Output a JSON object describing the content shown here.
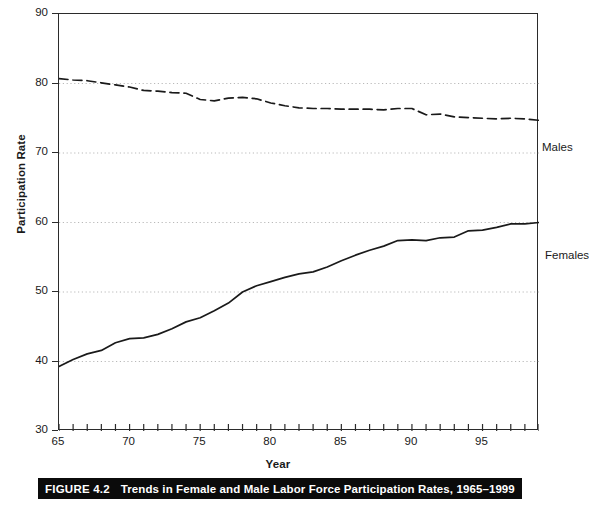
{
  "figure": {
    "caption_number": "FIGURE 4.2",
    "caption_text": "Trends in Female and Male Labor Force Participation Rates, 1965–1999"
  },
  "chart_data": {
    "type": "line",
    "title": "Trends in Female and Male Labor Force Participation Rates, 1965–1999",
    "xlabel": "Year",
    "ylabel": "Participation Rate",
    "xlim": [
      65,
      99
    ],
    "ylim": [
      30,
      90
    ],
    "ytick_labels": [
      "30",
      "40",
      "50",
      "60",
      "70",
      "80",
      "90"
    ],
    "ytick_values": [
      30,
      40,
      50,
      60,
      70,
      80,
      90
    ],
    "xtick_labels": [
      "65",
      "70",
      "75",
      "80",
      "85",
      "90",
      "95"
    ],
    "xtick_values": [
      65,
      70,
      75,
      80,
      85,
      90,
      95
    ],
    "xtick_minor_step": 1,
    "grid": "horizontal-dotted",
    "legend_position": "inline-right-of-series",
    "x": [
      65,
      66,
      67,
      68,
      69,
      70,
      71,
      72,
      73,
      74,
      75,
      76,
      77,
      78,
      79,
      80,
      81,
      82,
      83,
      84,
      85,
      86,
      87,
      88,
      89,
      90,
      91,
      92,
      93,
      94,
      95,
      96,
      97,
      98,
      99
    ],
    "series": [
      {
        "name": "Males",
        "linestyle": "dashed",
        "color": "#1a1a1a",
        "label_text": "Males",
        "values": [
          80.7,
          80.5,
          80.4,
          80.1,
          79.8,
          79.5,
          79.0,
          78.9,
          78.7,
          78.6,
          77.7,
          77.5,
          77.9,
          78.0,
          77.8,
          77.2,
          76.8,
          76.5,
          76.4,
          76.4,
          76.3,
          76.3,
          76.3,
          76.2,
          76.4,
          76.4,
          75.5,
          75.6,
          75.2,
          75.1,
          75.0,
          74.9,
          75.0,
          74.9,
          74.7
        ]
      },
      {
        "name": "Females",
        "linestyle": "solid",
        "color": "#1a1a1a",
        "label_text": "Females",
        "values": [
          39.3,
          40.3,
          41.1,
          41.6,
          42.7,
          43.3,
          43.4,
          43.9,
          44.7,
          45.7,
          46.3,
          47.3,
          48.4,
          50.0,
          50.9,
          51.5,
          52.1,
          52.6,
          52.9,
          53.6,
          54.5,
          55.3,
          56.0,
          56.6,
          57.4,
          57.5,
          57.4,
          57.8,
          57.9,
          58.8,
          58.9,
          59.3,
          59.8,
          59.8,
          60.0
        ]
      }
    ]
  },
  "axes": {
    "y_title": "Participation Rate",
    "x_title": "Year"
  }
}
